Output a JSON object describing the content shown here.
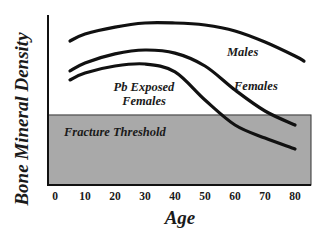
{
  "chart_data": {
    "type": "line",
    "title": "",
    "xlabel": "Age",
    "ylabel": "Bone Mineral Density",
    "x_ticks": [
      0,
      10,
      20,
      30,
      40,
      50,
      60,
      70,
      80
    ],
    "xlim": [
      0,
      85
    ],
    "ylim": [
      0,
      100
    ],
    "y_units": "relative (no numeric ticks shown)",
    "grid": false,
    "legend": "none (inline curve labels)",
    "x": [
      5,
      10,
      20,
      30,
      40,
      50,
      60,
      70,
      80
    ],
    "series": [
      {
        "name": "Males",
        "values": [
          84.7,
          88.8,
          92.9,
          95.3,
          95.3,
          94.1,
          90.6,
          84.1,
          75.9
        ],
        "end_point": {
          "x": 83,
          "y": 72.9
        }
      },
      {
        "name": "Females",
        "values": [
          67.1,
          71.8,
          77.1,
          79.4,
          77.6,
          70.0,
          55.9,
          43.5,
          35.3
        ]
      },
      {
        "name": "Pb Exposed Females",
        "values": [
          61.8,
          65.9,
          70.0,
          71.2,
          66.5,
          50.0,
          35.3,
          27.6,
          21.2
        ]
      }
    ],
    "regions": [
      {
        "name": "Fracture Threshold",
        "type": "shaded band",
        "y_from": 0,
        "y_to": 41.2,
        "x_from": -2,
        "x_to": 85,
        "color": "#a9a9a9"
      }
    ],
    "annotations": [
      {
        "text": "Males",
        "x": 62,
        "y": 84
      },
      {
        "text": "Females",
        "x": 67,
        "y": 62
      },
      {
        "text": "Pb Exposed",
        "x": 25,
        "y": 57
      },
      {
        "text": "Females",
        "x": 25,
        "y": 49
      },
      {
        "text": "Fracture Threshold",
        "x": 14,
        "y": 35
      }
    ]
  },
  "labels": {
    "ylabel": "Bone Mineral Density",
    "xlabel": "Age",
    "ticks": [
      "0",
      "10",
      "20",
      "30",
      "40",
      "50",
      "60",
      "70",
      "80"
    ],
    "males": "Males",
    "females": "Females",
    "pb_line1": "Pb Exposed",
    "pb_line2": "Females",
    "threshold": "Fracture Threshold"
  },
  "colors": {
    "line": "#111111",
    "threshold_fill": "#a9a9a9",
    "axis": "#111111"
  }
}
